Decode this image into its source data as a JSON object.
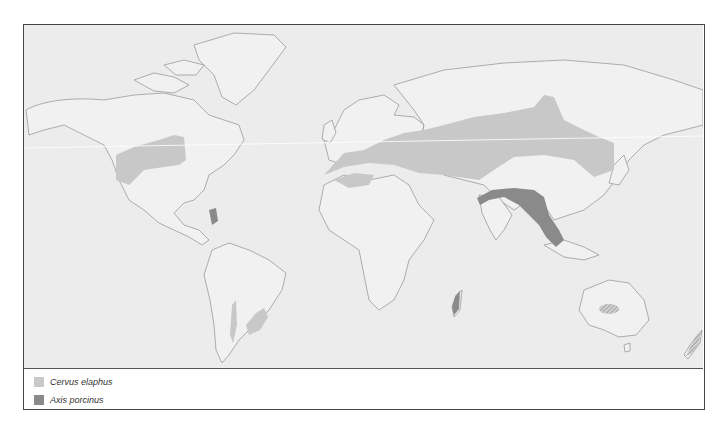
{
  "map": {
    "title": "World distribution map",
    "ocean_color": "#ececec",
    "land_color": "#f1f1f1",
    "coast_color": "#9a9a9a",
    "regions": [
      {
        "species": "Cervus elaphus",
        "area": "Western North America"
      },
      {
        "species": "Cervus elaphus",
        "area": "Europe and Central Asia"
      },
      {
        "species": "Cervus elaphus",
        "area": "North Africa"
      },
      {
        "species": "Cervus elaphus",
        "area": "Southern South America (introduced)"
      },
      {
        "species": "Cervus elaphus",
        "area": "Southeast Australia (introduced, hatched)"
      },
      {
        "species": "Cervus elaphus",
        "area": "New Zealand (introduced, hatched)"
      },
      {
        "species": "Axis porcinus",
        "area": "Northern India to Indochina"
      },
      {
        "species": "Axis porcinus",
        "area": "Florida (introduced)"
      },
      {
        "species": "Axis porcinus",
        "area": "Madagascar"
      }
    ]
  },
  "legend": {
    "items": [
      {
        "label": "Cervus elaphus",
        "color": "#c8c8c8"
      },
      {
        "label": "Axis porcinus",
        "color": "#8a8a8a"
      }
    ]
  }
}
